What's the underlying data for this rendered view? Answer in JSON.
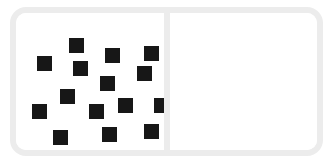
{
  "figure": {
    "kind": "domino-tile",
    "background_color": "#ffffff",
    "border_color": "#ececec",
    "divider_color": "#ececec",
    "pip_color": "#171717",
    "left_half": {
      "name": "left-half",
      "pip_count": 15,
      "label": "15"
    },
    "right_half": {
      "name": "right-half",
      "pip_count": 0,
      "label": "0"
    }
  },
  "chart_data": {
    "type": "scatter",
    "title": "",
    "subtitle": "",
    "xlabel": "",
    "ylabel": "",
    "xlim": [
      0,
      148
    ],
    "ylim": [
      0,
      137
    ],
    "grid": false,
    "legend": null,
    "marker": "square",
    "marker_color": "#171717",
    "marker_size": 15,
    "series": [
      {
        "name": "left-half-pips",
        "count": 15,
        "points": [
          {
            "x": 53,
            "y": 25
          },
          {
            "x": 21,
            "y": 43
          },
          {
            "x": 89,
            "y": 35
          },
          {
            "x": 128,
            "y": 33
          },
          {
            "x": 57,
            "y": 48
          },
          {
            "x": 121,
            "y": 53
          },
          {
            "x": 84,
            "y": 63
          },
          {
            "x": 44,
            "y": 76
          },
          {
            "x": 16,
            "y": 91
          },
          {
            "x": 73,
            "y": 91
          },
          {
            "x": 102,
            "y": 85
          },
          {
            "x": 138,
            "y": 85
          },
          {
            "x": 37,
            "y": 117
          },
          {
            "x": 86,
            "y": 114
          },
          {
            "x": 128,
            "y": 111
          }
        ]
      },
      {
        "name": "right-half-pips",
        "count": 0,
        "points": []
      }
    ]
  }
}
